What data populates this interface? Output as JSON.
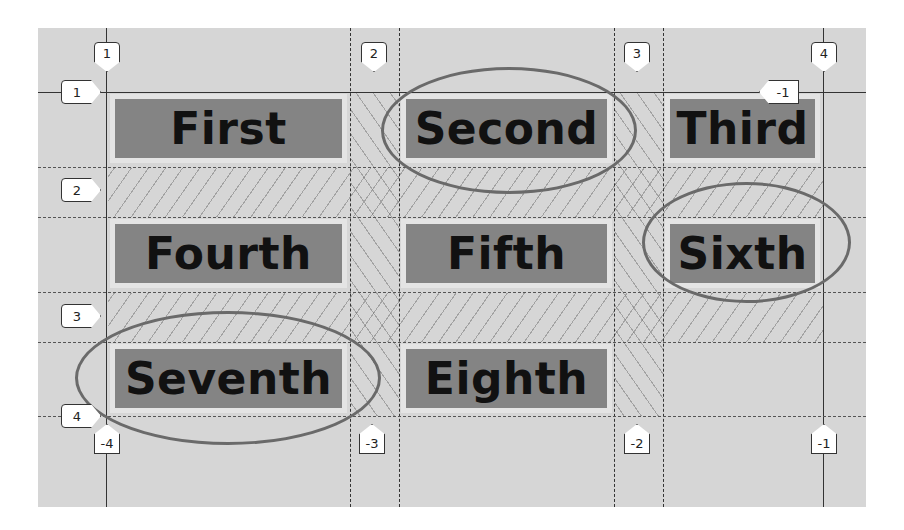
{
  "diagram": {
    "items": [
      {
        "label": "First",
        "highlighted": false
      },
      {
        "label": "Second",
        "highlighted": true
      },
      {
        "label": "Third",
        "highlighted": false
      },
      {
        "label": "Fourth",
        "highlighted": false
      },
      {
        "label": "Fifth",
        "highlighted": false
      },
      {
        "label": "Sixth",
        "highlighted": true
      },
      {
        "label": "Seventh",
        "highlighted": true
      },
      {
        "label": "Eighth",
        "highlighted": false
      }
    ],
    "column_line_labels_top": [
      "1",
      "2",
      "3",
      "4"
    ],
    "column_line_labels_bottom": [
      "-4",
      "-3",
      "-2",
      "-1"
    ],
    "row_line_labels_left": [
      "1",
      "2",
      "3",
      "4"
    ],
    "row_line_labels_right": [
      "-1"
    ],
    "colors": {
      "panel_background": "#d6d6d6",
      "item_background": "#848484",
      "item_text": "#111111",
      "grid_line": "#333333",
      "highlight_ellipse": "#6a6a6a"
    }
  }
}
